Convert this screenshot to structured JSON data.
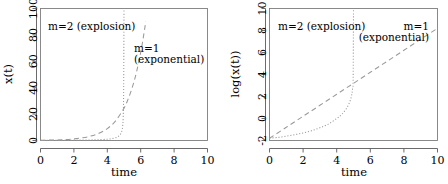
{
  "figure": {
    "panel_count": 2,
    "background_color": "#ffffff",
    "curve_color": "#9a9a9a",
    "axis_color": "#5a5a5a"
  },
  "chart_data": [
    {
      "type": "line",
      "panel": "left",
      "title": "",
      "xlabel": "time",
      "ylabel": "x(t)",
      "xlim": [
        0,
        10
      ],
      "ylim": [
        0,
        100
      ],
      "xticks": [
        0,
        2,
        4,
        6,
        8,
        10
      ],
      "yticks": [
        0,
        20,
        40,
        60,
        80,
        100
      ],
      "xtick_labels": [
        "0",
        "2",
        "4",
        "6",
        "8",
        "10"
      ],
      "ytick_labels": [
        "0",
        "20",
        "40",
        "60",
        "80",
        "100"
      ],
      "grid": false,
      "legend_position": "inline-annotations",
      "annotations": [
        {
          "text": "m=2 (explosion)",
          "x": 1.0,
          "y": 90,
          "lines": [
            "m=2 (explosion)"
          ]
        },
        {
          "text": "m=1 (exponential)",
          "x": 6.0,
          "y": 70,
          "lines": [
            "m=1",
            "(exponential)"
          ]
        }
      ],
      "series": [
        {
          "name": "m=1 (exponential)",
          "style": "dashed",
          "x": [
            0.0,
            0.5,
            1.0,
            1.5,
            2.0,
            2.5,
            3.0,
            3.5,
            4.0,
            4.5,
            5.0,
            5.25,
            5.5,
            5.75,
            6.0,
            6.2,
            6.3
          ],
          "y": [
            0.17,
            0.27,
            0.45,
            0.74,
            1.22,
            2.01,
            3.32,
            5.47,
            9.03,
            14.88,
            24.53,
            31.5,
            40.4,
            51.9,
            66.7,
            81.5,
            90.0
          ]
        },
        {
          "name": "m=2 (explosion)",
          "style": "dotted",
          "x": [
            0.0,
            0.5,
            1.0,
            1.5,
            2.0,
            2.5,
            3.0,
            3.5,
            4.0,
            4.3,
            4.6,
            4.8,
            4.9,
            4.95,
            4.98,
            5.0
          ],
          "y": [
            0.17,
            0.18,
            0.2,
            0.23,
            0.27,
            0.33,
            0.43,
            0.6,
            1.0,
            1.45,
            2.6,
            5.0,
            9.0,
            17.0,
            40.0,
            100.0
          ]
        }
      ]
    },
    {
      "type": "line",
      "panel": "right",
      "title": "",
      "xlabel": "time",
      "ylabel": "log(x(t))",
      "xlim": [
        0,
        10
      ],
      "ylim": [
        -2,
        10
      ],
      "xticks": [
        0,
        2,
        4,
        6,
        8,
        10
      ],
      "yticks": [
        -2,
        0,
        2,
        4,
        6,
        8,
        10
      ],
      "xtick_labels": [
        "0",
        "2",
        "4",
        "6",
        "8",
        "10"
      ],
      "ytick_labels": [
        "-2",
        "0",
        "2",
        "4",
        "6",
        "8",
        "10"
      ],
      "grid": false,
      "legend_position": "inline-annotations",
      "annotations": [
        {
          "text": "m=2 (explosion)",
          "x": 0.8,
          "y": 9.0,
          "lines": [
            "m=2 (explosion)"
          ]
        },
        {
          "text": "m=1 (exponential)",
          "x": 8.4,
          "y": 8.2,
          "lines": [
            "m=1",
            "(exponential)"
          ]
        }
      ],
      "series": [
        {
          "name": "m=1 (exponential)",
          "style": "dashed",
          "x": [
            0,
            1,
            2,
            3,
            4,
            5,
            6,
            7,
            8,
            9,
            10
          ],
          "y": [
            -1.8,
            -0.8,
            0.2,
            1.2,
            2.2,
            3.2,
            4.2,
            5.2,
            6.2,
            7.2,
            8.2
          ]
        },
        {
          "name": "m=2 (explosion)",
          "style": "dotted",
          "x": [
            0.0,
            0.5,
            1.0,
            1.5,
            2.0,
            2.5,
            3.0,
            3.5,
            4.0,
            4.3,
            4.6,
            4.8,
            4.9,
            4.95,
            4.98,
            5.0
          ],
          "y": [
            -1.78,
            -1.72,
            -1.61,
            -1.47,
            -1.31,
            -1.11,
            -0.84,
            -0.51,
            0.0,
            0.37,
            0.96,
            1.61,
            2.2,
            2.83,
            3.69,
            10.0
          ]
        }
      ]
    }
  ]
}
